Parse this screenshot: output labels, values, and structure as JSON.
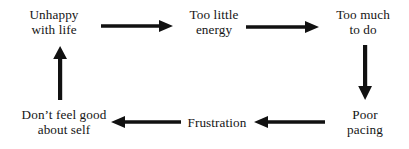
{
  "diagram": {
    "type": "cycle-flowchart",
    "background_color": "#ffffff",
    "text_color": "#141414",
    "arrow_color": "#111111",
    "nodes": [
      {
        "id": "unhappy",
        "line1": "Unhappy",
        "line2": "with life"
      },
      {
        "id": "too-little-energy",
        "line1": "Too little",
        "line2": "energy"
      },
      {
        "id": "too-much-to-do",
        "line1": "Too much",
        "line2": "to do"
      },
      {
        "id": "poor-pacing",
        "line1": "Poor",
        "line2": "pacing"
      },
      {
        "id": "frustration",
        "line1": "Frustration",
        "line2": ""
      },
      {
        "id": "dont-feel-good",
        "line1": "Don’t feel good",
        "line2": "about self"
      }
    ],
    "arrows": [
      {
        "id": "unhappy-to-energy",
        "from": "unhappy",
        "to": "too-little-energy",
        "direction": "right"
      },
      {
        "id": "energy-to-toomuch",
        "from": "too-little-energy",
        "to": "too-much-to-do",
        "direction": "right"
      },
      {
        "id": "toomuch-to-pacing",
        "from": "too-much-to-do",
        "to": "poor-pacing",
        "direction": "down"
      },
      {
        "id": "pacing-to-frust",
        "from": "poor-pacing",
        "to": "frustration",
        "direction": "left"
      },
      {
        "id": "frust-to-dontfeel",
        "from": "frustration",
        "to": "dont-feel-good",
        "direction": "left"
      },
      {
        "id": "dontfeel-to-unhappy",
        "from": "dont-feel-good",
        "to": "unhappy",
        "direction": "up"
      }
    ]
  }
}
